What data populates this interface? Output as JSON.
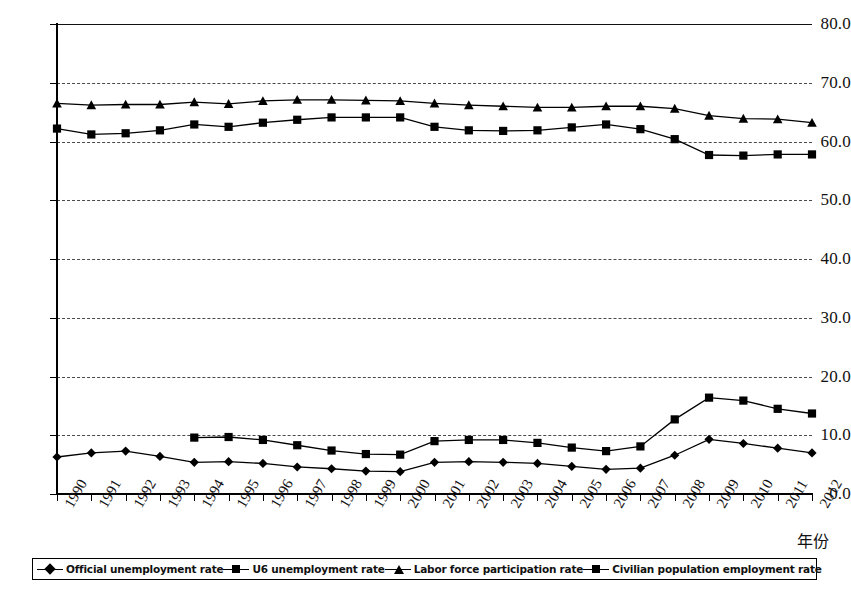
{
  "chart_data": {
    "type": "line",
    "title": "",
    "xlabel": "年份",
    "ylabel": "",
    "ylim": [
      0.0,
      80.0
    ],
    "yticks": [
      "0.0",
      "10.0",
      "20.0",
      "30.0",
      "40.0",
      "50.0",
      "60.0",
      "70.0",
      "80.0"
    ],
    "ytick_values": [
      0,
      10,
      20,
      30,
      40,
      50,
      60,
      70,
      80
    ],
    "grid": true,
    "legend_position": "bottom",
    "categories": [
      "1990",
      "1991",
      "1992",
      "1993",
      "1994",
      "1995",
      "1996",
      "1997",
      "1998",
      "1999",
      "2000",
      "2001",
      "2002",
      "2003",
      "2004",
      "2005",
      "2006",
      "2007",
      "2008",
      "2009",
      "2010",
      "2011",
      "2012"
    ],
    "series": [
      {
        "name": "Official unemployment rate",
        "marker": "diamond",
        "values": [
          6.3,
          7.0,
          7.3,
          6.4,
          5.4,
          5.5,
          5.2,
          4.6,
          4.3,
          3.9,
          3.8,
          5.4,
          5.5,
          5.4,
          5.2,
          4.7,
          4.2,
          4.4,
          6.6,
          9.3,
          8.6,
          7.8,
          7.0
        ]
      },
      {
        "name": "U6 unemployment rate",
        "marker": "square",
        "values": [
          null,
          null,
          null,
          null,
          9.6,
          9.7,
          9.2,
          8.3,
          7.4,
          6.8,
          6.7,
          9.0,
          9.2,
          9.2,
          8.7,
          7.9,
          7.3,
          8.1,
          12.7,
          16.4,
          15.9,
          14.5,
          13.7
        ]
      },
      {
        "name": "Labor force participation rate",
        "marker": "triangle",
        "values": [
          66.5,
          66.2,
          66.3,
          66.3,
          66.7,
          66.4,
          66.9,
          67.1,
          67.1,
          67.0,
          66.9,
          66.5,
          66.2,
          66.0,
          65.8,
          65.8,
          66.0,
          66.0,
          65.6,
          64.4,
          63.9,
          63.8,
          63.2
        ]
      },
      {
        "name": "Civilian population employment rate",
        "marker": "square",
        "values": [
          62.2,
          61.2,
          61.4,
          61.9,
          62.9,
          62.5,
          63.2,
          63.7,
          64.1,
          64.1,
          64.1,
          62.5,
          61.9,
          61.8,
          61.9,
          62.4,
          62.9,
          62.1,
          60.4,
          57.7,
          57.6,
          57.8,
          57.8
        ]
      }
    ]
  },
  "legend": {
    "items": [
      {
        "label": "Official unemployment rate",
        "marker": "diamond-marker"
      },
      {
        "label": "U6 unemployment rate",
        "marker": "square-marker"
      },
      {
        "label": "Labor force participation rate",
        "marker": "triangle-marker"
      },
      {
        "label": "Civilian population employment rate",
        "marker": "square-marker"
      }
    ]
  },
  "caption": ""
}
